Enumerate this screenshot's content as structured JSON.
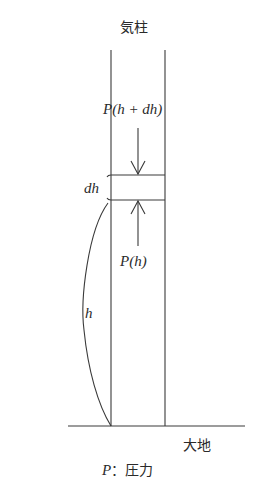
{
  "diagram": {
    "title": "気柱",
    "labels": {
      "pressure_top": "P(h + dh)",
      "slab_thickness": "dh",
      "pressure_bottom": "P(h)",
      "height": "h",
      "ground": "大地",
      "legend": "P：圧力"
    },
    "colors": {
      "line": "#3a3a3a",
      "text": "#2a2a2a",
      "background": "#ffffff"
    },
    "geometry": {
      "column_left_x": 111,
      "column_right_x": 165,
      "column_top_y": 50,
      "ground_y": 426,
      "slab_top_y": 175,
      "slab_bottom_y": 200
    }
  }
}
